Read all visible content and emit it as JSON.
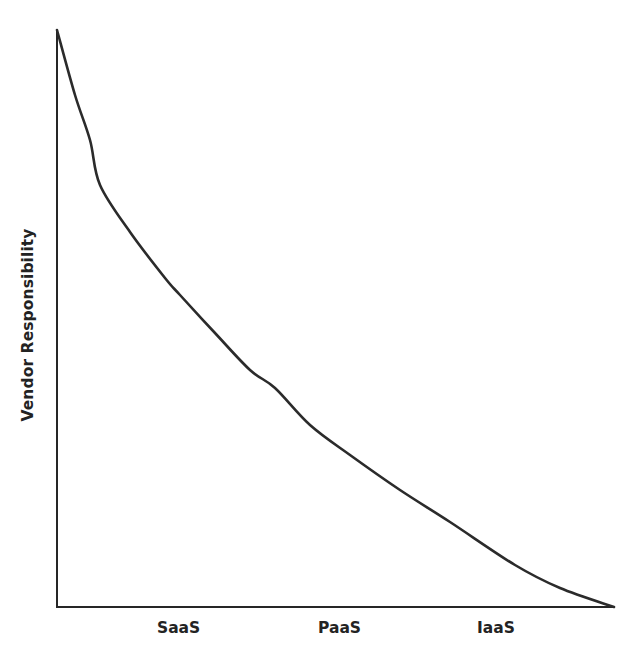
{
  "chart_data": {
    "type": "line",
    "title": "",
    "subtitle": "",
    "xlabel": "",
    "ylabel": "Vendor Responsibility",
    "categories": [
      "SaaS",
      "PaaS",
      "IaaS"
    ],
    "tick_labels": {
      "x": [
        "SaaS",
        "PaaS",
        "IaaS"
      ],
      "y": []
    },
    "grid": false,
    "legend": null,
    "legend_position": "none",
    "xlim": [
      0,
      100
    ],
    "ylim": [
      0,
      100
    ],
    "annotations": [],
    "series": [
      {
        "name": "Vendor Responsibility",
        "color": "#2b2b2b",
        "x": [
          0,
          3,
          6,
          8,
          12,
          16,
          19,
          23,
          28,
          35,
          40,
          45,
          50,
          56,
          62,
          70,
          82,
          92,
          100
        ],
        "y": [
          100,
          89,
          84,
          81,
          73,
          66,
          62,
          57,
          51,
          44,
          40,
          36,
          32,
          27,
          23,
          18,
          10,
          5,
          0
        ],
        "points_px": [
          [
            57,
            30
          ],
          [
            75,
            95
          ],
          [
            90,
            140
          ],
          [
            100,
            185
          ],
          [
            130,
            232
          ],
          [
            165,
            278
          ],
          [
            180,
            295
          ],
          [
            215,
            333
          ],
          [
            250,
            370
          ],
          [
            275,
            388
          ],
          [
            310,
            425
          ],
          [
            350,
            455
          ],
          [
            400,
            490
          ],
          [
            450,
            522
          ],
          [
            515,
            565
          ],
          [
            560,
            588
          ],
          [
            614,
            607
          ]
        ]
      }
    ]
  },
  "axes": {
    "y_title": "Vendor Responsibility",
    "x_tick_0": "SaaS",
    "x_tick_1": "PaaS",
    "x_tick_2": "IaaS",
    "line_color": "#262626",
    "curve_color": "#2b2b2b",
    "background": "#ffffff"
  }
}
